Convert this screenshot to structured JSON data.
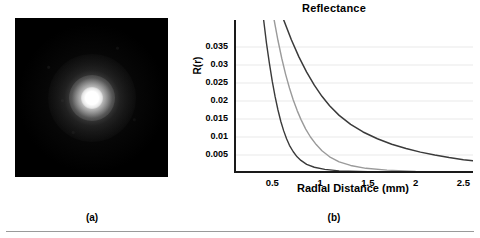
{
  "figure": {
    "panel_a": {
      "caption": "(a)",
      "image_name": "speckle-beam-profile",
      "description": "black field with bright central gaussian spot"
    },
    "panel_b": {
      "caption": "(b)"
    }
  },
  "chart_data": {
    "type": "line",
    "title": "Reflectance",
    "xlabel": "Radial Distance (mm)",
    "ylabel": "R(r)",
    "xlim": [
      0.1,
      2.6
    ],
    "ylim": [
      0,
      0.0425
    ],
    "grid": true,
    "legend": "none",
    "xticks": [
      0.5,
      1,
      1.5,
      2,
      2.5
    ],
    "xtick_labels": [
      "0.5",
      "1",
      "1.5",
      "2",
      "2.5"
    ],
    "yticks": [
      0.005,
      0.01,
      0.015,
      0.02,
      0.025,
      0.03,
      0.035
    ],
    "ytick_labels": [
      "0.005",
      "0.01",
      "0.015",
      "0.02",
      "0.025",
      "0.03",
      "0.035"
    ],
    "series": [
      {
        "name": "curve-1",
        "color": "#3a3a3a",
        "width": 1.4,
        "x": [
          0.41,
          0.44,
          0.47,
          0.5,
          0.53,
          0.56,
          0.59,
          0.62,
          0.65,
          0.68,
          0.72,
          0.76,
          0.8,
          0.86,
          0.94,
          1.05,
          1.2,
          1.4,
          1.7,
          2.1,
          2.6
        ],
        "y": [
          0.0425,
          0.036,
          0.0305,
          0.0255,
          0.0212,
          0.0175,
          0.0143,
          0.0117,
          0.0095,
          0.0077,
          0.0059,
          0.0045,
          0.0035,
          0.0024,
          0.0016,
          0.001,
          0.0006,
          0.0004,
          0.0002,
          0.0001,
          0.0
        ]
      },
      {
        "name": "curve-2",
        "color": "#9a9a9a",
        "width": 1.4,
        "x": [
          0.52,
          0.56,
          0.6,
          0.64,
          0.68,
          0.72,
          0.76,
          0.8,
          0.85,
          0.9,
          0.96,
          1.02,
          1.1,
          1.2,
          1.32,
          1.48,
          1.7,
          2.0,
          2.3,
          2.6
        ],
        "y": [
          0.0425,
          0.0368,
          0.0318,
          0.0274,
          0.0236,
          0.0203,
          0.0174,
          0.0149,
          0.0122,
          0.01,
          0.0079,
          0.0062,
          0.0045,
          0.0031,
          0.0021,
          0.0013,
          0.0008,
          0.0004,
          0.0002,
          0.0001
        ]
      },
      {
        "name": "curve-3",
        "color": "#3a3a3a",
        "width": 1.5,
        "x": [
          0.62,
          0.7,
          0.78,
          0.86,
          0.94,
          1.02,
          1.1,
          1.2,
          1.32,
          1.45,
          1.6,
          1.75,
          1.9,
          2.05,
          2.2,
          2.35,
          2.5,
          2.6
        ],
        "y": [
          0.0425,
          0.037,
          0.0322,
          0.028,
          0.0244,
          0.0213,
          0.0187,
          0.016,
          0.0135,
          0.0114,
          0.0095,
          0.008,
          0.0068,
          0.0058,
          0.005,
          0.0043,
          0.0037,
          0.0034
        ]
      }
    ]
  }
}
